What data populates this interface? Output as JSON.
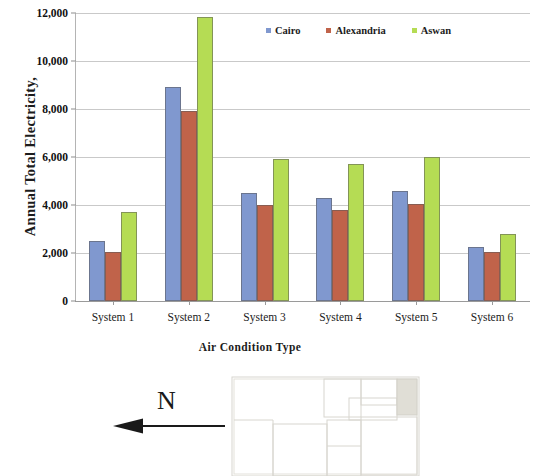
{
  "figure": {
    "north_indicator": {
      "label": "N",
      "icon": "north-arrow-icon",
      "direction": "left"
    },
    "floor_plan": {
      "icon": "floor-plan-icon",
      "description": "faint architectural floor plan outline"
    }
  },
  "chart_data": {
    "type": "bar",
    "title": "",
    "xlabel": "Air Condition Type",
    "ylabel": "Annual Total Electricity,",
    "categories": [
      "System 1",
      "System 2",
      "System 3",
      "System 4",
      "System 5",
      "System 6"
    ],
    "series": [
      {
        "name": "Cairo",
        "color": "#8098cf",
        "values": [
          2500,
          8900,
          4500,
          4300,
          4600,
          2250
        ]
      },
      {
        "name": "Alexandria",
        "color": "#c0634a",
        "values": [
          2050,
          7900,
          4000,
          3800,
          4050,
          2050
        ]
      },
      {
        "name": "Aswan",
        "color": "#b5dc54",
        "values": [
          3700,
          11850,
          5900,
          5700,
          6000,
          2800
        ]
      }
    ],
    "ylim": [
      0,
      12000
    ],
    "yticks": [
      0,
      2000,
      4000,
      6000,
      8000,
      10000,
      12000
    ],
    "ytick_labels": [
      "0",
      "2,000",
      "4,000",
      "6,000",
      "8,000",
      "10,000",
      "12,000"
    ],
    "grid": true,
    "legend_position": "top-right"
  }
}
